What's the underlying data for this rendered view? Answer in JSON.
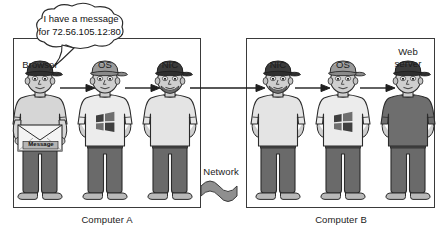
{
  "diagram": {
    "title_not_shown": "",
    "speech_bubble": {
      "line1": "I have a message",
      "line2": "for 72.56.105.12:80."
    },
    "envelope_label": "Message",
    "network_label": "Network",
    "computer_a": {
      "caption": "Computer A",
      "roles": [
        {
          "label": "Browser"
        },
        {
          "label": "OS"
        },
        {
          "label": "NIC"
        }
      ]
    },
    "computer_b": {
      "caption": "Computer B",
      "roles": [
        {
          "label": "NIC"
        },
        {
          "label": "OS"
        },
        {
          "label": "Web",
          "label2": "server"
        }
      ]
    },
    "colors": {
      "outline": "#3a3a3a",
      "ink": "#1a1a1a",
      "skin": "#cfcfcf",
      "shirt_light": "#e8e8e8",
      "shirt_mid": "#d0d0d0",
      "shirt_dark": "#6e6e6e",
      "hat_dark": "#3b3b3b",
      "hat_mid": "#8e8e8e",
      "pants": "#6a6a6a",
      "network": "#8a8a8a"
    }
  }
}
